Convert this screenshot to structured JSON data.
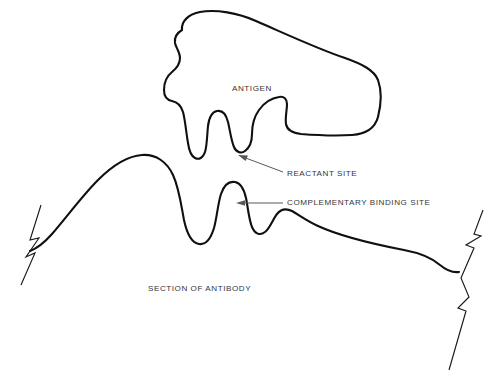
{
  "figure": {
    "background_color": "#ffffff",
    "outline_color": "#101010",
    "label_color": "#333638",
    "leader_color": "#55585c",
    "width": 494,
    "height": 387
  },
  "labels": {
    "antigen": "ANTIGEN",
    "reactant_site": "REACTANT SITE",
    "complementary_binding_site": "COMPLEMENTARY BINDING SITE",
    "section_of_antibody": "SECTION OF ANTIBODY"
  },
  "label_positions": {
    "antigen": {
      "x": 232,
      "y": 89
    },
    "reactant_site": {
      "x": 287,
      "y": 174
    },
    "complementary_binding_site": {
      "x": 287,
      "y": 203
    },
    "section_of_antibody": {
      "x": 148,
      "y": 289
    }
  },
  "annotations": [
    {
      "name": "reactant-site-pointer",
      "label": "REACTANT SITE",
      "arrow_tip": {
        "x": 240,
        "y": 156
      },
      "arrow_tail": {
        "x": 283,
        "y": 172
      },
      "style": "diagonal"
    },
    {
      "name": "complementary-binding-site-pointer",
      "label": "COMPLEMENTARY BINDING SITE",
      "arrow_tip": {
        "x": 238,
        "y": 203
      },
      "arrow_tail": {
        "x": 283,
        "y": 203
      },
      "style": "horizontal"
    }
  ],
  "shapes": {
    "antigen": {
      "name": "antigen-outline",
      "description": "Irregular closed blob with two finger-like protrusions on its lower edge that key into the antibody surface",
      "path": "M 182 30 C 181 21 189 14 200 12 C 216 9 238 13 256 21 C 286 34 318 49 345 58 C 362 64 374 70 378 80 C 382 91 381 105 378 117 C 375 128 366 134 352 135 C 336 136 314 135 301 134 C 292 133 287 130 286 124 C 285 118 287 110 287 104 C 287 99 284 96 279 97 C 272 98 264 103 259 110 C 254 117 252 126 252 134 C 252 142 249 148 245 151 C 241 154 236 152 234 147 C 231 140 230 130 228 122 C 226 114 222 110 217 111 C 212 112 209 118 208 126 C 207 136 207 146 205 152 C 203 158 199 160 195 158 C 191 156 189 150 188 143 C 186 131 185 119 183 112 C 181 105 177 102 172 101 C 167 100 164 96 164 90 C 164 83 167 76 172 72 C 177 68 180 64 180 58 C 180 52 176 48 175 43 C 174 37 177 33 182 30 Z"
    },
    "antibody": {
      "name": "antibody-outline",
      "description": "Undulating surface of an antibody section with raised bumps complementary to the antigen notches, torn at both ends",
      "path": "M 30 251 C 38 248 44 243 52 234 C 66 218 82 196 98 180 C 112 166 128 156 142 155 C 156 154 167 162 173 175 C 179 188 181 204 184 220 C 187 234 192 243 199 244 C 206 245 211 238 214 228 C 217 217 218 203 221 194 C 224 185 229 181 235 182 C 241 183 244 189 246 198 C 248 208 249 220 252 227 C 255 234 260 236 265 232 C 270 228 273 219 277 214 C 281 209 286 208 292 211 C 299 215 307 221 318 226 C 342 237 378 245 404 250 C 420 253 432 258 440 265 C 446 270 452 273 459 272"
    }
  },
  "break_marks": [
    {
      "name": "left-break-mark",
      "description": "Zigzag torn-edge symbol at left end of antibody section",
      "path": "M 41 205 L 30 240 L 39 238 L 26 257 L 35 253 L 21 285"
    },
    {
      "name": "right-break-mark",
      "description": "Long zigzag torn-edge symbol at right end of antibody section",
      "path": "M 483 210 L 474 234 L 481 236 L 466 245 L 474 248 L 461 278 L 469 297 L 458 308 L 466 311 L 449 370"
    }
  ]
}
